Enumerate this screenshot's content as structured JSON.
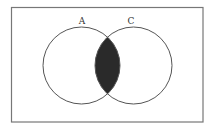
{
  "diagram": {
    "type": "venn",
    "sets": [
      {
        "id": "A",
        "label": "A",
        "cx": 81.5,
        "cy": 65.5,
        "r": 38.5
      },
      {
        "id": "C",
        "label": "C",
        "cx": 133.5,
        "cy": 65.5,
        "r": 38.5
      }
    ],
    "shaded_region": "A ∩ C",
    "universe_box": {
      "x": 11.5,
      "y": 7.5,
      "width": 191.5,
      "height": 114.5
    },
    "colors": {
      "background": "#ffffff",
      "outline": "#555555",
      "shade": "#2a2a2a",
      "label": "#333333"
    }
  }
}
